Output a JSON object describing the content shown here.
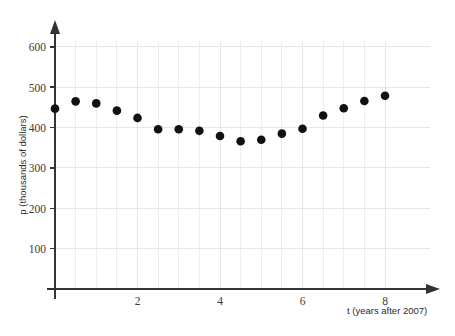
{
  "chart_data": {
    "type": "scatter",
    "title": "",
    "xlabel": "t (years after 2007)",
    "ylabel": "p (thousands of dollars)",
    "xlim": [
      0,
      8.35
    ],
    "ylim": [
      0,
      640
    ],
    "xticks": [
      2,
      4,
      6,
      8
    ],
    "xtick_labels": [
      "2",
      "4",
      "6",
      "8"
    ],
    "yticks": [
      100,
      200,
      300,
      400,
      500,
      600
    ],
    "ytick_labels": [
      "100",
      "200",
      "300",
      "400",
      "500",
      "600"
    ],
    "grid": true,
    "grid_x_step": 0.5,
    "grid_y_step": 100,
    "legend": "none",
    "marker": "filled-circle",
    "marker_color": "#111111",
    "x": [
      0,
      0.5,
      1,
      1.5,
      2,
      2.5,
      3,
      3.5,
      4,
      4.5,
      5,
      5.5,
      6,
      6.5,
      7,
      7.5,
      8
    ],
    "y": [
      447,
      465,
      460,
      442,
      424,
      396,
      396,
      392,
      379,
      366,
      370,
      385,
      397,
      430,
      448,
      466,
      479
    ],
    "points": [
      {
        "t": 0,
        "p": 447
      },
      {
        "t": 0.5,
        "p": 465
      },
      {
        "t": 1,
        "p": 460
      },
      {
        "t": 1.5,
        "p": 442
      },
      {
        "t": 2,
        "p": 424
      },
      {
        "t": 2.5,
        "p": 396
      },
      {
        "t": 3,
        "p": 396
      },
      {
        "t": 3.5,
        "p": 392
      },
      {
        "t": 4,
        "p": 379
      },
      {
        "t": 4.5,
        "p": 366
      },
      {
        "t": 5,
        "p": 370
      },
      {
        "t": 5.5,
        "p": 385
      },
      {
        "t": 6,
        "p": 397
      },
      {
        "t": 6.5,
        "p": 430
      },
      {
        "t": 7,
        "p": 448
      },
      {
        "t": 7.5,
        "p": 466
      },
      {
        "t": 8,
        "p": 479
      }
    ]
  },
  "axes": {
    "x_axis_title": "t (years after 2007)",
    "y_axis_title": "p (thousands of dollars)"
  },
  "colors": {
    "marker": "#111111",
    "axis": "#333333",
    "grid": "#e6e6e6",
    "background": "#ffffff"
  }
}
